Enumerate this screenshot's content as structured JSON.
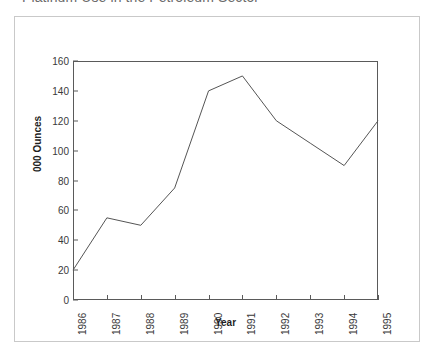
{
  "chart_data": {
    "type": "line",
    "title": "Platinum Use in the Petroleum Sector",
    "xlabel": "Year",
    "ylabel": "000 Ounces",
    "categories": [
      "1986",
      "1987",
      "1988",
      "1989",
      "1990",
      "1991",
      "1992",
      "1993",
      "1994",
      "1995"
    ],
    "values": [
      20,
      55,
      50,
      75,
      140,
      150,
      120,
      105,
      90,
      120
    ],
    "series": [
      {
        "name": "Platinum Use",
        "values": [
          20,
          55,
          50,
          75,
          140,
          150,
          120,
          105,
          90,
          120
        ]
      }
    ],
    "ylim": [
      0,
      160
    ],
    "y_ticks": [
      0,
      20,
      40,
      60,
      80,
      100,
      120,
      140,
      160
    ],
    "y_tick_labels": [
      "0",
      "20",
      "40",
      "60",
      "80",
      "100",
      "120",
      "140",
      "160"
    ],
    "grid": false,
    "legend": false,
    "legend_position": "none",
    "line_color": "#555555",
    "frame_color": "#c9c9c9",
    "axis_color": "#5a5a5a",
    "title_color": "#6b6b6b"
  }
}
